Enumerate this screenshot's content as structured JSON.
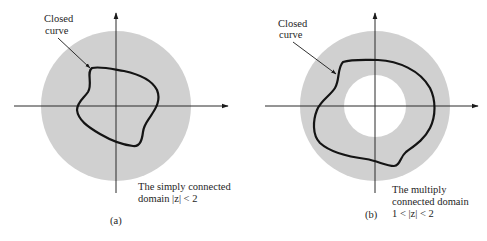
{
  "figure": {
    "colors": {
      "background": "#ffffff",
      "domain_fill": "#d0d0d0",
      "hole_fill": "#ffffff",
      "curve_stroke": "#141414",
      "axis_stroke": "#2a2a2a",
      "text": "#1e1e1e"
    },
    "panels": [
      {
        "id": "a",
        "caption": "(a)",
        "curve_label_line1": "Closed",
        "curve_label_line2": "curve",
        "domain_label_line1": "The simply connected",
        "domain_label_line2": "domain |z| < 2",
        "domain_type": "simply connected",
        "domain_condition": "|z| < 2",
        "outer_radius_value": 2
      },
      {
        "id": "b",
        "caption": "(b)",
        "curve_label_line1": "Closed",
        "curve_label_line2": "curve",
        "domain_label_line1": "The multiply",
        "domain_label_line2": "connected domain",
        "domain_label_line3": "1 < |z| < 2",
        "domain_type": "multiply connected",
        "domain_condition": "1 < |z| < 2",
        "inner_radius_value": 1,
        "outer_radius_value": 2
      }
    ]
  }
}
